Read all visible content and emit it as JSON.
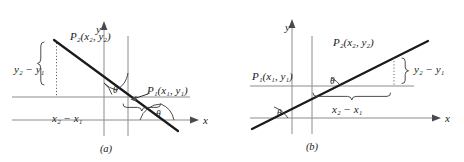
{
  "figure": {
    "title_text": "",
    "colors": {
      "ink": "#1a1a1a",
      "axis_gray": "#8c8c8c",
      "brace_gray": "#3a3a3a",
      "background": "#ffffff"
    },
    "panels": [
      {
        "id": "a",
        "caption": "(a)",
        "slope_sign": "negative",
        "axes": {
          "y_label": "y",
          "x_label": "x"
        },
        "points": [
          {
            "name": "P2",
            "label_p": "P",
            "label_sub": "2",
            "label_coords": "(x₂, y₂)",
            "label_full": "P₂(x₂, y₂)"
          },
          {
            "name": "P1",
            "label_p": "P",
            "label_sub": "1",
            "label_coords": "(x₁, y₁)",
            "label_full": "P₁(x₁, y₁)"
          }
        ],
        "measures": [
          {
            "name": "delta-y",
            "label": "y₂ − y₁",
            "orientation": "vertical",
            "position": "left"
          },
          {
            "name": "delta-x",
            "label": "x₂ − x₁",
            "orientation": "horizontal",
            "position": "below"
          }
        ],
        "angles": [
          {
            "name": "theta-at-point",
            "label": "θ"
          },
          {
            "name": "theta-at-axis",
            "label": "θ"
          }
        ]
      },
      {
        "id": "b",
        "caption": "(b)",
        "slope_sign": "positive",
        "axes": {
          "y_label": "y",
          "x_label": "x"
        },
        "points": [
          {
            "name": "P1",
            "label_p": "P",
            "label_sub": "1",
            "label_coords": "(x₁, y₁)",
            "label_full": "P₁(x₁, y₁)"
          },
          {
            "name": "P2",
            "label_p": "P",
            "label_sub": "2",
            "label_coords": "(x₂, y₂)",
            "label_full": "P₂(x₂, y₂)"
          }
        ],
        "measures": [
          {
            "name": "delta-y",
            "label": "y₂ − y₁",
            "orientation": "vertical",
            "position": "right"
          },
          {
            "name": "delta-x",
            "label": "x₂ − x₁",
            "orientation": "horizontal",
            "position": "below"
          }
        ],
        "angles": [
          {
            "name": "theta-at-point",
            "label": "θ"
          },
          {
            "name": "theta-at-axis",
            "label": "θ"
          }
        ]
      }
    ]
  }
}
